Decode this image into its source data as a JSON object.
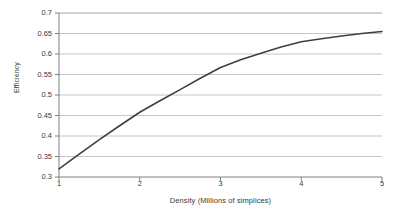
{
  "chart_data": {
    "type": "line",
    "title": "",
    "xlabel": "Density (Millions of simplices)",
    "ylabel": "Efficiency",
    "x": [
      1,
      1.25,
      1.5,
      1.75,
      2,
      2.25,
      2.5,
      2.75,
      3,
      3.25,
      3.5,
      3.75,
      4,
      4.25,
      4.5,
      4.75,
      5
    ],
    "values": [
      0.32,
      0.356,
      0.391,
      0.425,
      0.458,
      0.486,
      0.513,
      0.541,
      0.567,
      0.586,
      0.602,
      0.617,
      0.63,
      0.637,
      0.644,
      0.65,
      0.655
    ],
    "series": [
      {
        "name": "Efficiency",
        "color": "#3f3f3f",
        "values": [
          0.32,
          0.356,
          0.391,
          0.425,
          0.458,
          0.486,
          0.513,
          0.541,
          0.567,
          0.586,
          0.602,
          0.617,
          0.63,
          0.637,
          0.644,
          0.65,
          0.655
        ]
      }
    ],
    "xlim": [
      1,
      5
    ],
    "ylim": [
      0.3,
      0.7
    ],
    "xticks": [
      1,
      2,
      3,
      4,
      5
    ],
    "xtick_labels": [
      "1",
      "2",
      "3",
      "4",
      "5"
    ],
    "yticks": [
      0.3,
      0.35,
      0.4,
      0.45,
      0.5,
      0.55,
      0.6,
      0.65,
      0.7
    ],
    "ytick_labels": [
      "0.3",
      "0.35",
      "0.4",
      "0.45",
      "0.5",
      "0.55",
      "0.6",
      "0.65",
      "0.7"
    ],
    "grid": {
      "horizontal": true,
      "vertical": false
    },
    "legend": {
      "visible": false,
      "position": "none"
    },
    "plot_background": "#ffffff",
    "gridline_color": "#b8b8b8",
    "axis_color": "#808080",
    "line_width": 1.6
  }
}
